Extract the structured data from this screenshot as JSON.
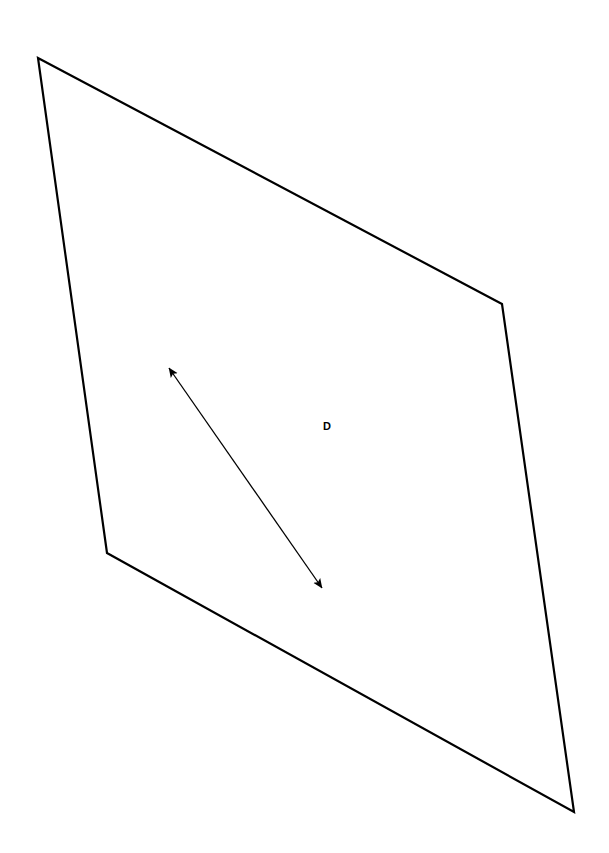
{
  "figure": {
    "background_color": "#ffffff",
    "stroke_color": "#000000",
    "canvas": {
      "width": 609,
      "height": 853
    }
  },
  "shape": {
    "name": "panel-outline",
    "type": "polygon",
    "closed": true,
    "stroke_width": 2.2,
    "fill": "none",
    "vertices": [
      {
        "id": "A",
        "x": 38,
        "y": 58
      },
      {
        "id": "B",
        "x": 502,
        "y": 304
      },
      {
        "id": "C",
        "x": 574,
        "y": 812
      },
      {
        "id": "D",
        "x": 107,
        "y": 553
      }
    ],
    "points_attr": "38,58 502,304 574,812 107,553"
  },
  "dimension": {
    "name": "diagonal-dimension",
    "label": "D",
    "label_x": 327,
    "label_y": 427,
    "arrow": {
      "style": "double-headed",
      "stroke_width": 1.3,
      "head_length": 14,
      "head_width": 7,
      "start": {
        "x": 169,
        "y": 368
      },
      "end": {
        "x": 322,
        "y": 588
      },
      "line_d": "M 169 368 L 322 588"
    }
  },
  "chart_data": {
    "type": "diagram",
    "elements": [
      {
        "kind": "polygon",
        "label": "panel outline",
        "vertices": [
          [
            38,
            58
          ],
          [
            502,
            304
          ],
          [
            574,
            812
          ],
          [
            107,
            553
          ]
        ]
      },
      {
        "kind": "double-arrow",
        "label": "D",
        "from": [
          169,
          368
        ],
        "to": [
          322,
          588
        ]
      },
      {
        "kind": "text",
        "label": "D",
        "at": [
          327,
          427
        ]
      }
    ]
  }
}
